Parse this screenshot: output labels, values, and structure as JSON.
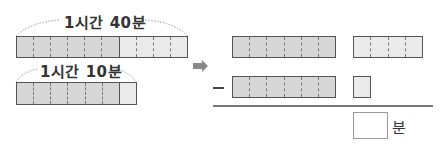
{
  "left": {
    "top_label": "1시간 40분",
    "top_bar": {
      "dark_cells": 6,
      "light_cells": 4
    },
    "bottom_label": "1시간 10분",
    "bottom_bar": {
      "dark_cells": 6,
      "light_cells": 1
    }
  },
  "arrow": {
    "icon": "right-arrow-icon",
    "color": "#888888"
  },
  "right": {
    "row1": {
      "hour_bar_cells": 6,
      "minute_bar_cells": 4
    },
    "operator": "−",
    "row2": {
      "hour_bar_cells": 6,
      "minute_bar_cells": 1
    },
    "answer": {
      "value": "",
      "unit": "분"
    }
  },
  "colors": {
    "dark_fill": "#d6d6d6",
    "light_fill": "#eaeaea",
    "border": "#555555"
  }
}
